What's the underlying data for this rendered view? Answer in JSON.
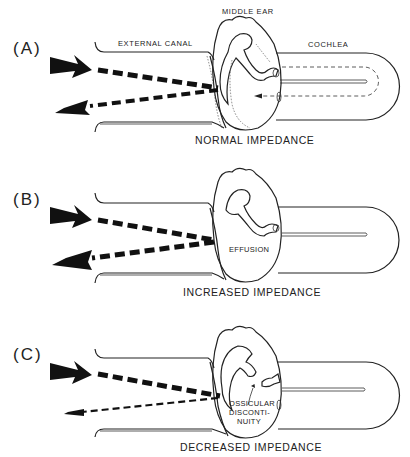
{
  "figure": {
    "type": "tympanometry-impedance-diagram",
    "colors": {
      "ink": "#222222",
      "background": "#ffffff"
    }
  },
  "structure_labels": {
    "middle_ear": "MIDDLE EAR",
    "external_canal": "EXTERNAL CANAL",
    "cochlea": "COCHLEA"
  },
  "panels": [
    {
      "label": "(A)",
      "caption": "NORMAL IMPEDANCE",
      "inner_text": [],
      "incident_arrow": "large",
      "reflected_arrow": "large"
    },
    {
      "label": "(B)",
      "caption": "INCREASED IMPEDANCE",
      "inner_text": [
        "EFFUSION"
      ],
      "incident_arrow": "large",
      "reflected_arrow": "large"
    },
    {
      "label": "(C)",
      "caption": "DECREASED IMPEDANCE",
      "inner_text": [
        "OSSICULAR",
        "DISCONTI-",
        "NUITY"
      ],
      "incident_arrow": "large",
      "reflected_arrow": "small"
    }
  ]
}
